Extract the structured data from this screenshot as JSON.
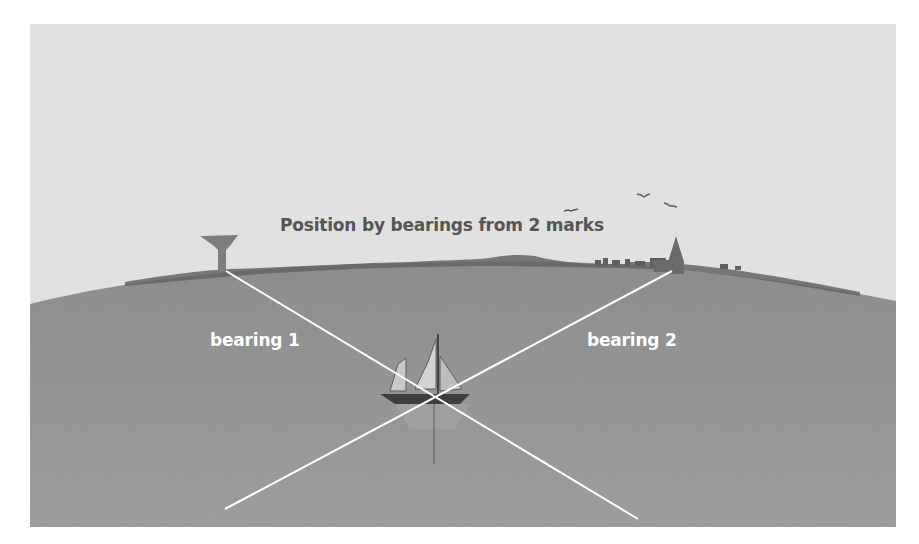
{
  "diagram": {
    "title": "Position by bearings from 2 marks",
    "labels": {
      "bearing_1": "bearing 1",
      "bearing_2": "bearing 2"
    },
    "marks": [
      {
        "name": "water tower",
        "icon": "water-tower-icon"
      },
      {
        "name": "church spire",
        "icon": "church-spire-icon"
      }
    ],
    "vessel": {
      "icon": "sailboat-icon"
    },
    "colors": {
      "sky": "#e4e4e4",
      "sea": "#8f8f8f",
      "land": "#5e5e5e",
      "bearing_lines": "#ffffff",
      "title_text": "#555555",
      "label_text": "#ffffff"
    }
  }
}
